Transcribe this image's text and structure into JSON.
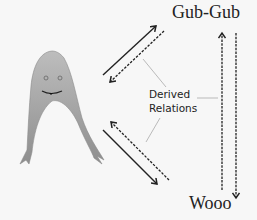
{
  "diagram": {
    "nodes": {
      "top_right": "Gub-Gub",
      "bottom_right": "Wooo"
    },
    "annotation": {
      "line1": "Derived",
      "line2": "Relations"
    },
    "figure": "fish-character",
    "colors": {
      "background": "#f7f7f7",
      "fish_fill": "#a8a8a8",
      "arrow": "#222222",
      "pointer_line": "#aaaaaa"
    }
  }
}
